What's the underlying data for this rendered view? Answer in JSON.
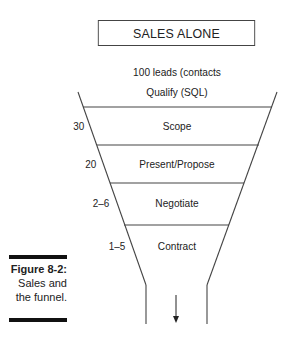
{
  "diagram": {
    "title": "SALES ALONE",
    "intro_line": "100 leads (contacts",
    "top_stage": "Qualify (SQL)",
    "stages": [
      {
        "count": "30",
        "label": "Scope"
      },
      {
        "count": "20",
        "label": "Present/Propose"
      },
      {
        "count": "2–6",
        "label": "Negotiate"
      },
      {
        "count": "1–5",
        "label": "Contract"
      }
    ],
    "output_icon": "down-arrow-icon",
    "line_color": "#444444"
  },
  "caption": {
    "figure": "Figure 8-2:",
    "line1": "Sales and",
    "line2": "the funnel."
  }
}
